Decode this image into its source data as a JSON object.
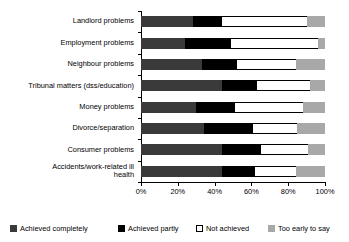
{
  "chart_data": {
    "type": "bar",
    "subtype": "stacked-horizontal-100percent",
    "title": "",
    "xlabel": "",
    "ylabel": "",
    "xlim": [
      0,
      100
    ],
    "xticks": [
      "0%",
      "20%",
      "40%",
      "60%",
      "80%",
      "100%"
    ],
    "xtick_values": [
      0,
      20,
      40,
      60,
      80,
      100
    ],
    "grid": false,
    "legend_position": "bottom",
    "categories": [
      "Landlord problems",
      "Employment problems",
      "Neighbour problems",
      "Tribunal matters (dss/education)",
      "Money problems",
      "Divorce/separation",
      "Consumer problems",
      "Accidents/work-related ill\nhealth"
    ],
    "series": [
      {
        "name": "Achieved completely",
        "color": "#3a3a3a",
        "values": [
          28,
          24,
          33,
          44,
          30,
          34,
          44,
          44
        ]
      },
      {
        "name": "Achieved partly",
        "color": "#000000",
        "values": [
          16,
          25,
          19,
          19,
          21,
          27,
          21,
          18
        ]
      },
      {
        "name": "Not achieved",
        "color": "#ffffff",
        "values": [
          46,
          47,
          32,
          29,
          37,
          24,
          26,
          22
        ]
      },
      {
        "name": "Too early to say",
        "color": "#a8a8a8",
        "values": [
          10,
          4,
          16,
          8,
          12,
          15,
          9,
          16
        ]
      }
    ]
  },
  "legend": {
    "items": [
      {
        "label": "Achieved completely"
      },
      {
        "label": "Achieved partly"
      },
      {
        "label": "Not achieved"
      },
      {
        "label": "Too early to say"
      }
    ]
  }
}
